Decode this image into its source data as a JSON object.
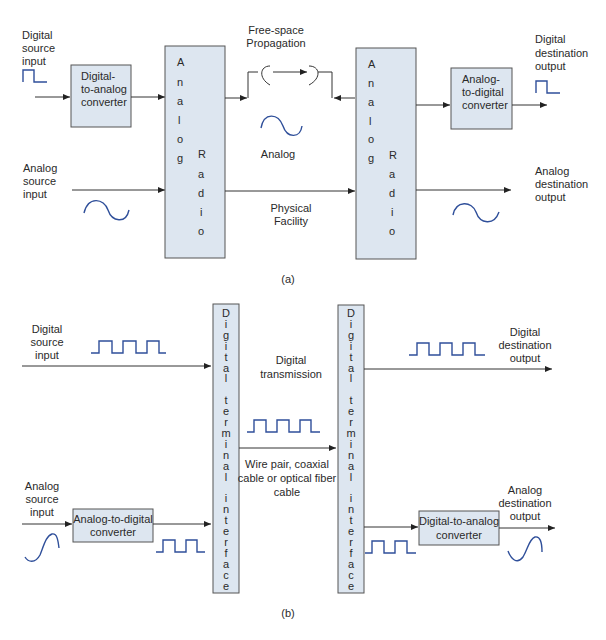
{
  "colors": {
    "box_fill": "#dde6f0",
    "box_stroke": "#555555",
    "wave": "#2f4f9a",
    "line": "#333333"
  },
  "panel_a": {
    "caption": "(a)",
    "digital_source": [
      "Digital",
      "source",
      "input"
    ],
    "analog_source": [
      "Analog",
      "source",
      "input"
    ],
    "dac": [
      "Digital-",
      "to-analog",
      "converter"
    ],
    "adc": [
      "Analog-",
      "to-digital",
      "converter"
    ],
    "radio_left_col1": [
      "A",
      "n",
      "a",
      "l",
      "o",
      "g"
    ],
    "radio_left_col2": [
      "R",
      "a",
      "d",
      "i",
      "o"
    ],
    "radio_right_col1": [
      "A",
      "n",
      "a",
      "l",
      "o",
      "g"
    ],
    "radio_right_col2": [
      "R",
      "a",
      "d",
      "i",
      "o"
    ],
    "free_space": [
      "Free-space",
      "Propagation"
    ],
    "analog_label": "Analog",
    "physical": [
      "Physical",
      "Facility"
    ],
    "digital_dest": [
      "Digital",
      "destination",
      "output"
    ],
    "analog_dest": [
      "Analog",
      "destination",
      "output"
    ]
  },
  "panel_b": {
    "caption": "(b)",
    "digital_source": [
      "Digital",
      "source",
      "input"
    ],
    "analog_source": [
      "Analog",
      "source",
      "input"
    ],
    "adc": [
      "Analog-to-digital",
      "converter"
    ],
    "dac": [
      "Digital-to-analog",
      "converter"
    ],
    "dti_left": [
      "D",
      "i",
      "g",
      "i",
      "t",
      "a",
      "l",
      "",
      "t",
      "e",
      "r",
      "m",
      "i",
      "n",
      "a",
      "l",
      "",
      "i",
      "n",
      "t",
      "e",
      "r",
      "f",
      "a",
      "c",
      "e"
    ],
    "dti_right": [
      "D",
      "i",
      "g",
      "i",
      "t",
      "a",
      "l",
      "",
      "t",
      "e",
      "r",
      "m",
      "i",
      "n",
      "a",
      "l",
      "",
      "i",
      "n",
      "t",
      "e",
      "r",
      "f",
      "a",
      "c",
      "e"
    ],
    "digital_transmission": [
      "Digital",
      "transmission"
    ],
    "medium": [
      "Wire pair, coaxial",
      "cable or optical fiber",
      "cable"
    ],
    "digital_dest": [
      "Digital",
      "destination",
      "output"
    ],
    "analog_dest": [
      "Analog",
      "destination",
      "output"
    ]
  }
}
